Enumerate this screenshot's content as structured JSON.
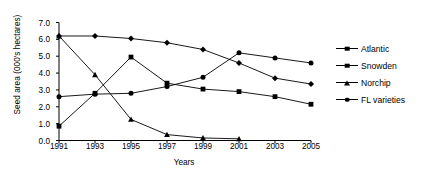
{
  "chart_data": {
    "type": "line",
    "title": "",
    "xlabel": "Years",
    "ylabel": "Seed area (000's hectares)",
    "x": [
      1991,
      1993,
      1995,
      1997,
      1999,
      2001,
      2003,
      2005
    ],
    "xticklabels": [
      "1991",
      "1993",
      "1995",
      "1997",
      "1999",
      "2001",
      "2003",
      "2005"
    ],
    "yticklabels": [
      "0.0",
      "1.0",
      "2.0",
      "3.0",
      "4.0",
      "5.0",
      "6.0",
      "7.0"
    ],
    "ylim": [
      0.0,
      7.0
    ],
    "ytick_step": 1.0,
    "grid": false,
    "legend_position": "right",
    "series": [
      {
        "name": "Atlantic",
        "marker": "diamond",
        "values": [
          6.2,
          6.2,
          6.05,
          5.8,
          5.4,
          4.6,
          3.7,
          3.35
        ]
      },
      {
        "name": "Snowden",
        "marker": "square",
        "values": [
          0.85,
          2.8,
          4.95,
          3.4,
          3.05,
          2.9,
          2.6,
          2.15
        ]
      },
      {
        "name": "Norchip",
        "marker": "triangle",
        "values": [
          6.2,
          3.9,
          1.25,
          0.35,
          0.15,
          0.1,
          null,
          null
        ]
      },
      {
        "name": "FL varieties",
        "marker": "circle",
        "values": [
          2.6,
          2.75,
          2.8,
          3.2,
          3.75,
          5.2,
          4.9,
          4.6
        ]
      }
    ]
  },
  "axes": {
    "x_label": "Years",
    "y_label": "Seed area (000's hectares)"
  },
  "legend": {
    "items": [
      {
        "label": "Atlantic"
      },
      {
        "label": "Snowden"
      },
      {
        "label": "Norchip"
      },
      {
        "label": "FL varieties"
      }
    ]
  },
  "style": {
    "line_color": "#000000",
    "background": "#ffffff"
  }
}
